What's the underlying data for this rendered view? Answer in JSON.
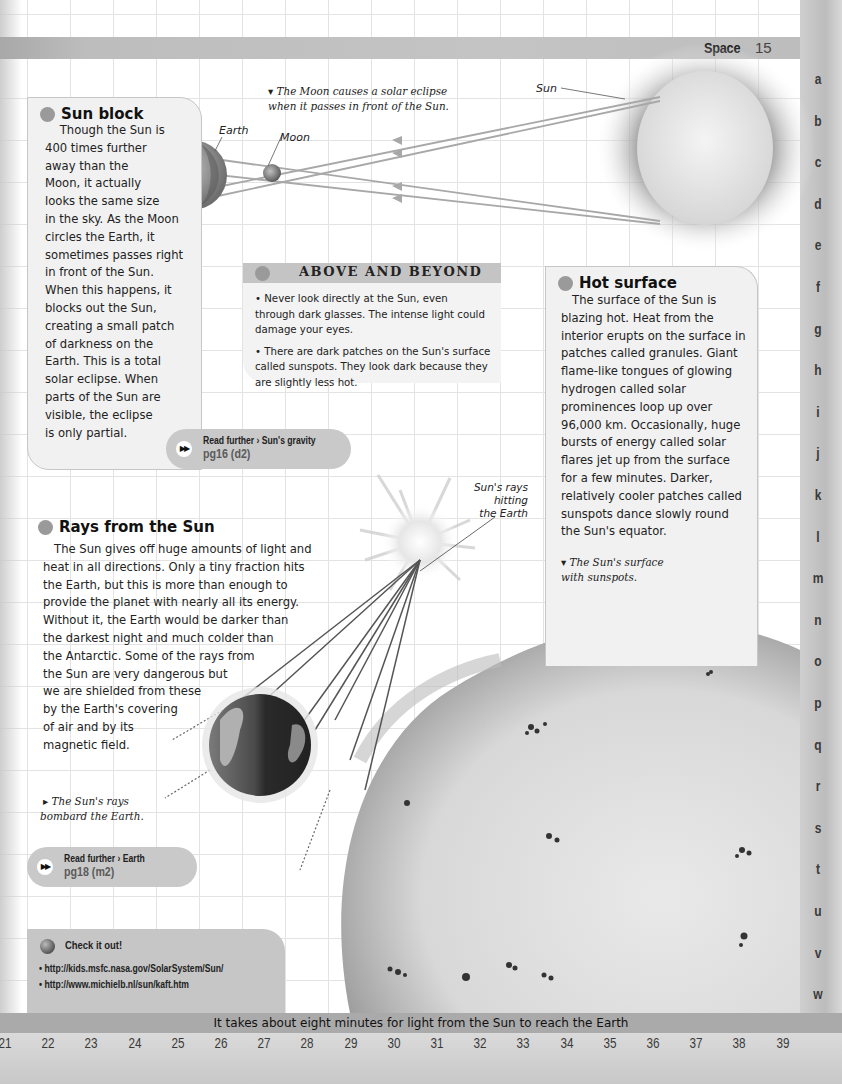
{
  "header": {
    "section": "Space",
    "page_number": "15"
  },
  "index_letters": [
    "a",
    "b",
    "c",
    "d",
    "e",
    "f",
    "g",
    "h",
    "i",
    "j",
    "k",
    "l",
    "m",
    "n",
    "o",
    "p",
    "q",
    "r",
    "s",
    "t",
    "u",
    "v",
    "w"
  ],
  "eclipse_diagram": {
    "caption": "The Moon causes a solar eclipse when it passes in front of the Sun.",
    "caption_line1": "The Moon causes a solar eclipse",
    "caption_line2": "when it passes in front of the Sun.",
    "labels": {
      "earth": "Earth",
      "moon": "Moon",
      "sun": "Sun"
    }
  },
  "sun_block": {
    "title": "Sun block",
    "lines": [
      "    Though the Sun is",
      "400 times further",
      "away than the",
      "Moon, it actually",
      "looks the same size",
      "in the sky. As the Moon",
      "circles the Earth, it",
      "sometimes passes right",
      "in front of the Sun.",
      "When this happens, it",
      "blocks out the Sun,",
      "creating a small patch",
      "of darkness on the",
      "Earth. This is a total",
      "solar eclipse. When",
      "parts of the Sun are",
      "visible, the eclipse",
      "is only partial."
    ],
    "read_further": {
      "label": "Read further › Sun's gravity",
      "ref": "pg16 (d2)"
    }
  },
  "above_and_beyond": {
    "title": "ABOVE AND BEYOND",
    "items": [
      "• Never look directly at the Sun, even through dark glasses. The intense light could damage your eyes.",
      "• There are dark patches on the Sun's surface called sunspots. They look dark because they are slightly less hot."
    ]
  },
  "hot_surface": {
    "title": "Hot surface",
    "lines": [
      "   The surface of the Sun is",
      "blazing hot. Heat from the",
      "interior erupts on the surface in",
      "patches called granules. Giant",
      "flame-like tongues of glowing",
      "hydrogen called solar",
      "prominences loop up over",
      "96,000 km. Occasionally, huge",
      "bursts of energy called solar",
      "flares jet up from the surface",
      "for a few minutes. Darker,",
      "relatively cooler patches called",
      "sunspots dance slowly round",
      "the Sun's equator."
    ],
    "caption_line1": "▾ The Sun's surface",
    "caption_line2": "with sunspots."
  },
  "rays_from_sun": {
    "title": "Rays from the Sun",
    "lines": [
      "   The Sun gives off huge amounts of light and",
      "heat in all directions. Only a tiny fraction hits",
      "the Earth, but this is more than enough to",
      "provide the planet with nearly all its energy.",
      "Without it, the Earth would be darker than",
      "the darkest night and much colder than",
      "the Antarctic. Some of the rays from",
      "the Sun are very dangerous but",
      "we are shielded from these",
      "by the Earth's covering",
      "of air and by its",
      "magnetic field."
    ],
    "rays_label": [
      "Sun's rays",
      "hitting",
      "the Earth"
    ],
    "caption_line1": "▸ The Sun's rays",
    "caption_line2": "bombard the Earth.",
    "read_further": {
      "label": "Read further › Earth",
      "ref": "pg18 (m2)"
    }
  },
  "check_it_out": {
    "title": "Check it out!",
    "links": [
      "• http://kids.msfc.nasa.gov/SolarSystem/Sun/",
      "• http://www.michielb.nl/sun/kaft.htm"
    ]
  },
  "footer": {
    "fact": "It takes about eight minutes for light from the Sun to reach the Earth",
    "grid_numbers": [
      "21",
      "22",
      "23",
      "24",
      "25",
      "26",
      "27",
      "28",
      "29",
      "30",
      "31",
      "32",
      "33",
      "34",
      "35",
      "36",
      "37",
      "38",
      "39"
    ]
  },
  "colors": {
    "band_gray": "#c4c4c4",
    "box_fill": "#f1f1f1",
    "pill_fill": "#c9c9c9",
    "grid_line": "#e3e3e3"
  }
}
